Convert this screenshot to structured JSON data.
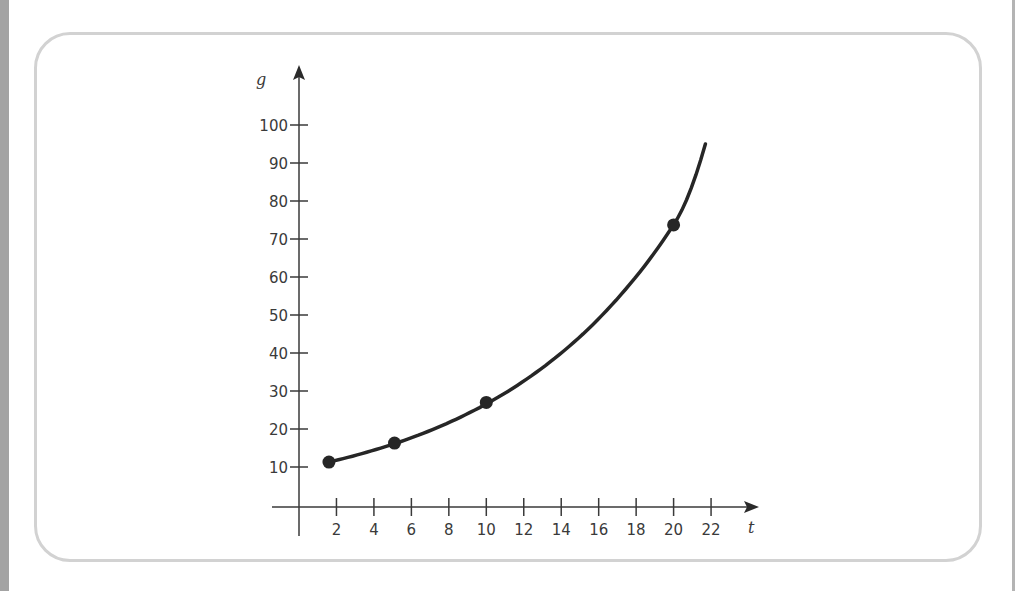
{
  "chart_data": {
    "type": "line",
    "title": "",
    "xlabel": "t",
    "ylabel": "g",
    "x_ticks": [
      2,
      4,
      6,
      8,
      10,
      12,
      14,
      16,
      18,
      20,
      22
    ],
    "y_ticks": [
      10,
      20,
      30,
      40,
      50,
      60,
      70,
      80,
      90,
      100
    ],
    "xlim": [
      0,
      23
    ],
    "ylim": [
      0,
      105
    ],
    "grid": false,
    "legend": null,
    "series": [
      {
        "name": "g(t)",
        "style": "smooth exponential curve",
        "curve_range": {
          "x": [
            1.6,
            21.7
          ],
          "y": [
            11.3,
            95
          ]
        },
        "points": [
          {
            "x": 1.6,
            "y": 11.3
          },
          {
            "x": 5.1,
            "y": 16.3
          },
          {
            "x": 10.0,
            "y": 27
          },
          {
            "x": 20.0,
            "y": 73.7
          }
        ]
      }
    ],
    "colors": {
      "curve": "#262626",
      "axis": "#3a3a3a",
      "frame": "#d2d2d2"
    }
  }
}
